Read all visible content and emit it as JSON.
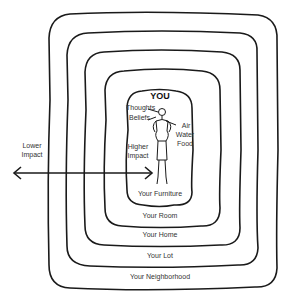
{
  "diagram": {
    "center_label": "YOU",
    "person_labels": {
      "thoughts": "Thoughts",
      "beliefs": "Beliefs",
      "air": "Air",
      "water": "Water",
      "food": "Food",
      "higher_impact_1": "Higher",
      "higher_impact_2": "Impact"
    },
    "arrow": {
      "lower_label_1": "Lower",
      "lower_label_2": "Impact"
    },
    "rings": [
      {
        "label": "Your Furniture"
      },
      {
        "label": "Your Room"
      },
      {
        "label": "Your Home"
      },
      {
        "label": "Your Lot"
      },
      {
        "label": "Your Neighborhood"
      }
    ],
    "colors": {
      "line": "#1a1a1a",
      "text": "#333333",
      "background": "#ffffff"
    }
  }
}
